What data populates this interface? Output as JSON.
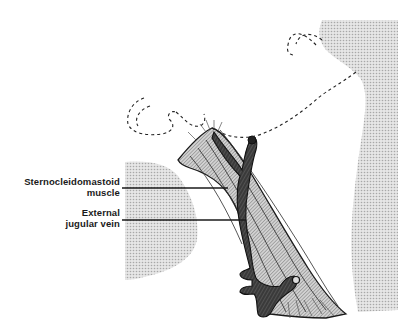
{
  "diagram": {
    "type": "anatomical illustration",
    "labels": [
      {
        "id": "scm",
        "lines": [
          "Sternocleidomastoid",
          "muscle"
        ]
      },
      {
        "id": "ejv",
        "lines": [
          "External",
          "jugular vein"
        ]
      }
    ],
    "colors": {
      "ink": "#1a1a1a",
      "stipple": "#c8c8c8",
      "muscle_hatch": "#7a7a7a",
      "vein": "#2a2a2a",
      "background": "#ffffff"
    }
  }
}
